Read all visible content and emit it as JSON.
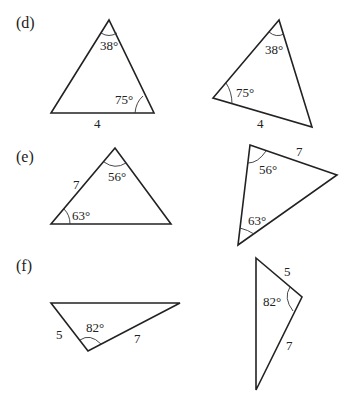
{
  "parts": [
    {
      "label": "(d)",
      "left": {
        "angle_top": "38°",
        "angle_bottom_right": "75°",
        "side_base": "4"
      },
      "right": {
        "angle_top": "38°",
        "angle_left": "75°",
        "side_bottom": "4"
      }
    },
    {
      "label": "(e)",
      "left": {
        "angle_top": "56°",
        "angle_bottom_left": "63°",
        "side_left": "7"
      },
      "right": {
        "angle_top_left": "56°",
        "angle_bottom": "63°",
        "side_top": "7"
      }
    },
    {
      "label": "(f)",
      "left": {
        "angle_bottom": "82°",
        "side_left": "5",
        "side_right": "7"
      },
      "right": {
        "angle_right": "82°",
        "side_top": "5",
        "side_bottom": "7"
      }
    }
  ]
}
